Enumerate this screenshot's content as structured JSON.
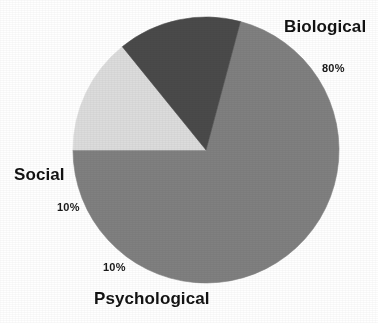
{
  "chart_data": {
    "type": "pie",
    "title": "",
    "subtitle": "",
    "xlabel": "",
    "ylabel": "",
    "legend_position": "none",
    "grid": false,
    "labels_placement": "outside",
    "total": 100,
    "units": "%",
    "categories": [
      "Biological",
      "Social",
      "Psychological"
    ],
    "values": [
      80,
      10,
      10
    ],
    "value_labels": [
      "80%",
      "10%",
      "10%"
    ],
    "colors": [
      "#808080",
      "#dcdcdc",
      "#4a4a4a"
    ],
    "slices": [
      {
        "name": "Biological",
        "label": "Biological",
        "value": 80,
        "value_label": "80%",
        "color": "#808080",
        "start_angle_deg": 285,
        "end_angle_deg": 180
      },
      {
        "name": "Social",
        "label": "Social",
        "value": 10,
        "value_label": "10%",
        "color": "#dcdcdc",
        "start_angle_deg": 180,
        "end_angle_deg": 231
      },
      {
        "name": "Psychological",
        "label": "Psychological",
        "value": 10,
        "value_label": "10%",
        "color": "#4a4a4a",
        "start_angle_deg": 231,
        "end_angle_deg": 285
      }
    ],
    "geometry": {
      "center_x": 206,
      "center_y": 150,
      "radius": 133
    }
  },
  "labels": {
    "biological": {
      "name": "Biological",
      "percent": "80%"
    },
    "social": {
      "name": "Social",
      "percent": "10%"
    },
    "psychological": {
      "name": "Psychological",
      "percent": "10%"
    }
  },
  "colors": {
    "biological": "#808080",
    "social": "#dcdcdc",
    "psychological": "#4a4a4a",
    "background": "#ffffff",
    "text": "#121212"
  }
}
